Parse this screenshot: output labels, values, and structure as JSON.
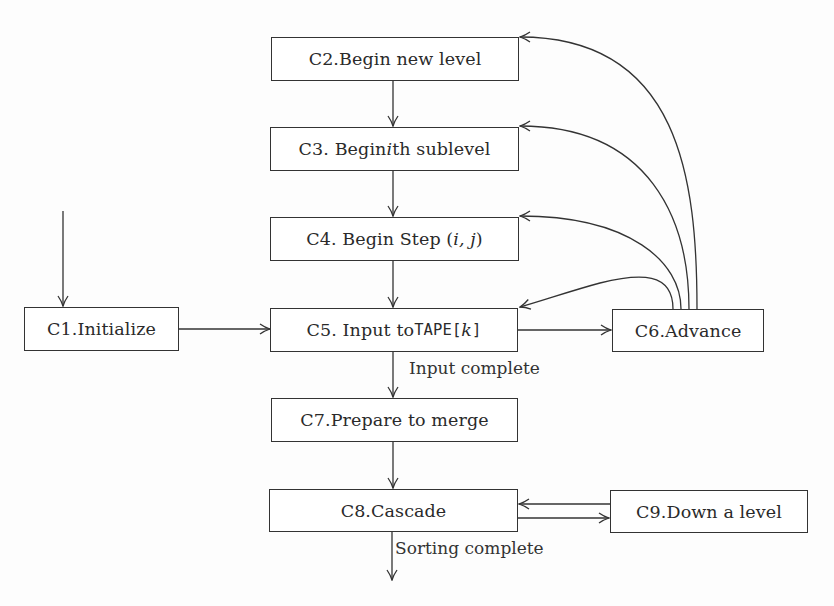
{
  "diagram": {
    "type": "flowchart",
    "nodes": [
      {
        "id": "C1",
        "label_prefix": "C1. ",
        "label_main": "Initialize",
        "label_suffix": ""
      },
      {
        "id": "C2",
        "label_prefix": "C2. ",
        "label_main": "Begin new level",
        "label_suffix": ""
      },
      {
        "id": "C3",
        "label_prefix": "C3. Begin ",
        "label_main": "i",
        "label_suffix": "th sublevel"
      },
      {
        "id": "C4",
        "label_prefix": "C4. Begin Step (",
        "label_main": "i, j",
        "label_suffix": ")"
      },
      {
        "id": "C5",
        "label_prefix": "C5. Input to ",
        "label_main": "TAPE[",
        "label_var": "k",
        "label_suffix": "]"
      },
      {
        "id": "C6",
        "label_prefix": "C6. ",
        "label_main": "Advance",
        "label_suffix": ""
      },
      {
        "id": "C7",
        "label_prefix": "C7. ",
        "label_main": "Prepare to merge",
        "label_suffix": ""
      },
      {
        "id": "C8",
        "label_prefix": "C8. ",
        "label_main": "Cascade",
        "label_suffix": ""
      },
      {
        "id": "C9",
        "label_prefix": "C9. ",
        "label_main": "Down a level",
        "label_suffix": ""
      }
    ],
    "edges": [
      {
        "from": "start",
        "to": "C1",
        "label": ""
      },
      {
        "from": "C1",
        "to": "C5",
        "label": ""
      },
      {
        "from": "C2",
        "to": "C3",
        "label": ""
      },
      {
        "from": "C3",
        "to": "C4",
        "label": ""
      },
      {
        "from": "C4",
        "to": "C5",
        "label": ""
      },
      {
        "from": "C5",
        "to": "C6",
        "label": ""
      },
      {
        "from": "C6",
        "to": "C5",
        "label": ""
      },
      {
        "from": "C6",
        "to": "C4",
        "label": ""
      },
      {
        "from": "C6",
        "to": "C3",
        "label": ""
      },
      {
        "from": "C6",
        "to": "C2",
        "label": ""
      },
      {
        "from": "C5",
        "to": "C7",
        "label": "Input complete"
      },
      {
        "from": "C7",
        "to": "C8",
        "label": ""
      },
      {
        "from": "C8",
        "to": "C9",
        "label": ""
      },
      {
        "from": "C9",
        "to": "C8",
        "label": ""
      },
      {
        "from": "C8",
        "to": "end",
        "label": "Sorting complete"
      }
    ],
    "edge_labels": {
      "input_complete": "Input complete",
      "sorting_complete": "Sorting complete"
    },
    "colors": {
      "line": "#333333",
      "background": "#ffffff",
      "text": "#2a2a2a"
    }
  }
}
